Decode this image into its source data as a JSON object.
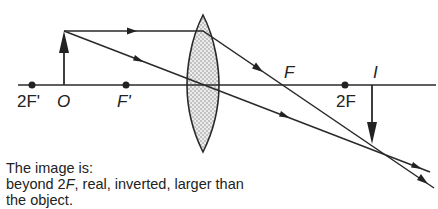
{
  "diagram": {
    "labels": {
      "two_f_prime": "2F'",
      "object": "O",
      "f_prime": "F'",
      "focal_point": "F",
      "two_f": "2F",
      "image": "I"
    },
    "colors": {
      "line": "#2a2a2a",
      "lens_fill": "#e6e6e6",
      "lens_dots": "#9a9a9a",
      "background": "#ffffff"
    }
  },
  "caption": {
    "line1": "The image is:",
    "line2_prefix": "beyond 2",
    "line2_italic": "F",
    "line2_suffix": ", real, inverted, larger than",
    "line3": "the object."
  }
}
